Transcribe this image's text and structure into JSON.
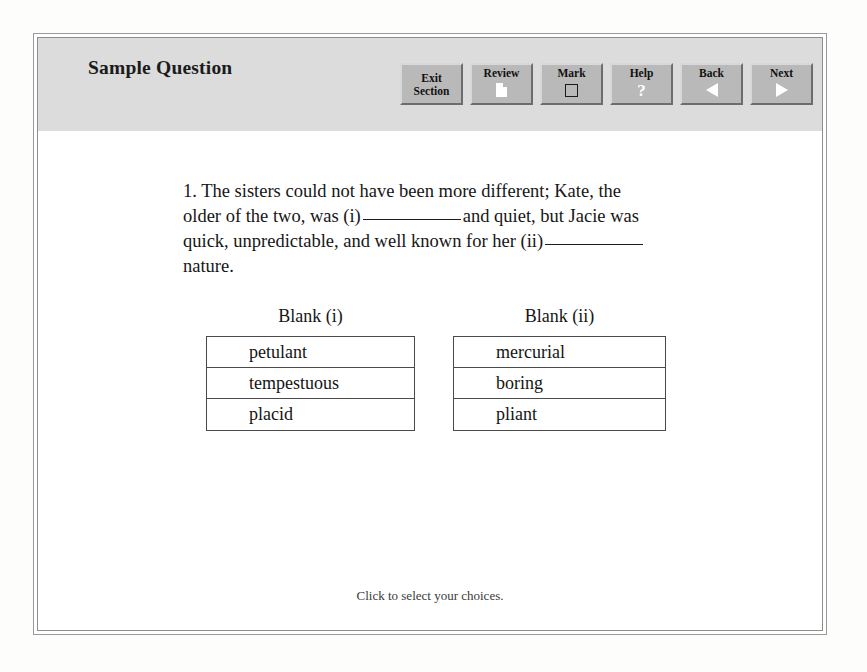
{
  "window": {
    "title": "Sample Question"
  },
  "toolbar": {
    "buttons": [
      {
        "label_line1": "Exit",
        "label_line2": "Section",
        "icon": "none",
        "name": "exit-section-button"
      },
      {
        "label_line1": "Review",
        "label_line2": "",
        "icon": "document-icon",
        "name": "review-button"
      },
      {
        "label_line1": "Mark",
        "label_line2": "",
        "icon": "checkbox-icon",
        "name": "mark-button"
      },
      {
        "label_line1": "Help",
        "label_line2": "",
        "icon": "question-mark-icon",
        "name": "help-button"
      },
      {
        "label_line1": "Back",
        "label_line2": "",
        "icon": "triangle-left-icon",
        "name": "back-button"
      },
      {
        "label_line1": "Next",
        "label_line2": "",
        "icon": "triangle-right-icon",
        "name": "next-button"
      }
    ]
  },
  "question": {
    "number": "1.",
    "segment_1": "1. The sisters could not have been more different; Kate, the older of the two, was (i)",
    "segment_2": "and quiet, but Jacie was quick, unpredictable, and well known for her (ii)",
    "segment_3": "nature."
  },
  "answers": {
    "groups": [
      {
        "heading": "Blank (i)",
        "choices": [
          "petulant",
          "tempestuous",
          "placid"
        ]
      },
      {
        "heading": "Blank (ii)",
        "choices": [
          "mercurial",
          "boring",
          "pliant"
        ]
      }
    ]
  },
  "footer": {
    "hint": "Click to select your choices."
  },
  "colors": {
    "header_band": "#dcdcdc",
    "button_face": "#b9b9b9",
    "page_background": "#ffffff",
    "text": "#161616"
  }
}
